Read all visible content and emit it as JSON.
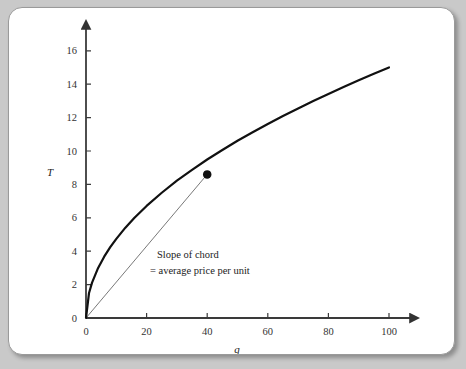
{
  "figure": {
    "background_color": "#c9c9c9",
    "card_color": "#ffffff",
    "border_color": "#9a9a9a"
  },
  "chart_data": {
    "type": "line",
    "title": "",
    "subtitle": "",
    "xlabel": "q",
    "ylabel": "T",
    "xlim": [
      0,
      100
    ],
    "ylim": [
      0,
      17
    ],
    "grid": false,
    "legend": null,
    "axis_style": "arrow-tipped half axes",
    "x_ticks": [
      0,
      20,
      40,
      60,
      80,
      100
    ],
    "x_tick_labels": [
      "0",
      "20",
      "40",
      "60",
      "80",
      "100"
    ],
    "y_ticks": [
      0,
      2,
      4,
      6,
      8,
      10,
      12,
      14,
      16
    ],
    "y_tick_labels": [
      "0",
      "2",
      "4",
      "6",
      "8",
      "10",
      "12",
      "14",
      "16"
    ],
    "series": [
      {
        "name": "total-outlay-curve",
        "type": "line",
        "color": "#111111",
        "width": 2.2,
        "description": "Concave increasing total outlay schedule T(q)",
        "x": [
          0,
          1,
          2,
          4,
          6,
          8,
          10,
          13,
          16,
          20,
          25,
          30,
          35,
          40,
          45,
          50,
          55,
          60,
          65,
          70,
          75,
          80,
          85,
          90,
          95,
          100
        ],
        "y": [
          0,
          1.5,
          2.12,
          3.0,
          3.67,
          4.24,
          4.74,
          5.41,
          6.0,
          6.71,
          7.5,
          8.22,
          8.87,
          9.49,
          10.06,
          10.61,
          11.12,
          11.62,
          12.1,
          12.55,
          12.99,
          13.42,
          13.83,
          14.23,
          14.62,
          15.0
        ]
      },
      {
        "name": "chord-line",
        "type": "line",
        "color": "#555555",
        "width": 0.8,
        "description": "Chord from origin to the marked point on the curve",
        "x": [
          0,
          40
        ],
        "y": [
          0,
          8.6
        ]
      }
    ],
    "points": [
      {
        "name": "chord-endpoint-marker",
        "x": 40,
        "y": 8.6,
        "marker": "filled-circle",
        "color": "#111111",
        "size": 5
      }
    ],
    "annotations": [
      {
        "name": "slope-of-chord-annotation",
        "line1": "Slope of chord",
        "line2": "= average price per unit",
        "x": 20,
        "y": 3.6
      }
    ]
  },
  "labels": {
    "y_axis_title": "T",
    "x_axis_title": "q",
    "annotation_line_1": "Slope of chord",
    "annotation_line_2": "= average price per unit"
  }
}
